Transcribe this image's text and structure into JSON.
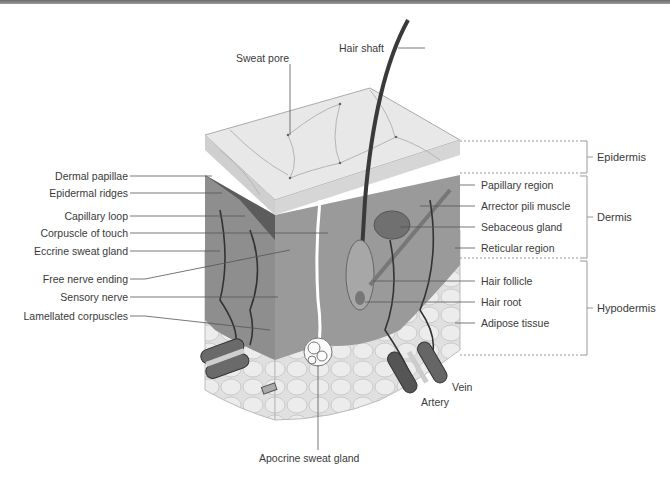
{
  "diagram": {
    "left_labels": [
      {
        "text": "Dermal papillae",
        "y": 176
      },
      {
        "text": "Epidermal ridges",
        "y": 193
      },
      {
        "text": "Capillary loop",
        "y": 216
      },
      {
        "text": "Corpuscle of touch",
        "y": 233
      },
      {
        "text": "Eccrine sweat gland",
        "y": 251
      },
      {
        "text": "Free nerve ending",
        "y": 279
      },
      {
        "text": "Sensory nerve",
        "y": 297
      },
      {
        "text": "Lamellated corpuscles",
        "y": 316
      }
    ],
    "right_labels": [
      {
        "text": "Papillary region",
        "y": 185
      },
      {
        "text": "Arrector pili muscle",
        "y": 206
      },
      {
        "text": "Sebaceous gland",
        "y": 227
      },
      {
        "text": "Reticular region",
        "y": 248
      },
      {
        "text": "Hair follicle",
        "y": 281
      },
      {
        "text": "Hair root",
        "y": 302
      },
      {
        "text": "Adipose tissue",
        "y": 323
      }
    ],
    "top_labels": {
      "hair_shaft": "Hair shaft",
      "sweat_pore": "Sweat pore"
    },
    "bottom_labels": {
      "apocrine": "Apocrine sweat gland",
      "artery": "Artery",
      "vein": "Vein"
    },
    "layers": [
      {
        "name": "Epidermis",
        "top": 141,
        "bottom": 173
      },
      {
        "name": "Dermis",
        "top": 176,
        "bottom": 258
      },
      {
        "name": "Hypodermis",
        "top": 261,
        "bottom": 355
      }
    ],
    "colors": {
      "epidermis_surface": "#e6e6e6",
      "dermis": "#8c8c8c",
      "dermis_dark": "#5a5a5a",
      "hypodermis": "#d9d9d9",
      "line": "#555555",
      "text": "#3a3a3a"
    }
  }
}
